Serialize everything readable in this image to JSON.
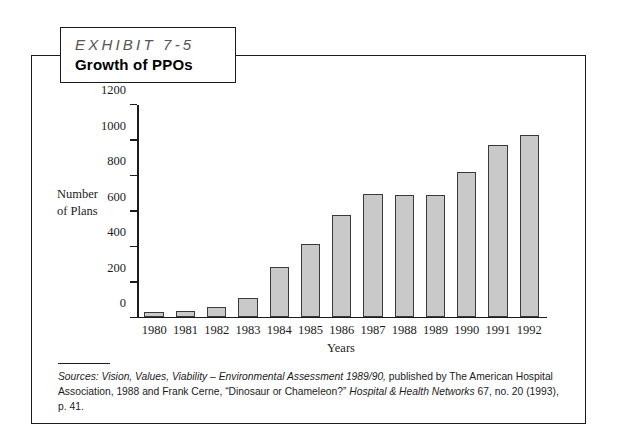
{
  "exhibit": {
    "kicker": "EXHIBIT 7-5",
    "title": "Growth of PPOs"
  },
  "source": {
    "label": "Sources:",
    "italic_1": "Vision, Values, Viability – Environmental Assessment 1989/90,",
    "plain_1": " published by The American Hospital Association, 1988 and Frank Cerne, “Dinosaur or Chameleon?” ",
    "italic_2": "Hospital & Health Networks",
    "plain_2": " 67, no. 20 (1993), p. 41."
  },
  "chart_data": {
    "type": "bar",
    "title": "Growth of PPOs",
    "xlabel": "Years",
    "ylabel": "Number of Plans",
    "ylim": [
      0,
      1200
    ],
    "yticks": [
      0,
      200,
      400,
      600,
      800,
      1000,
      1200
    ],
    "ytick_labels": [
      "0",
      "200",
      "400",
      "600",
      "800",
      "1000",
      "1200"
    ],
    "grid": false,
    "legend": null,
    "bar_color": "#c9c9c9",
    "bar_border_color": "#3a3a3a",
    "categories": [
      "1980",
      "1981",
      "1982",
      "1983",
      "1984",
      "1985",
      "1986",
      "1987",
      "1988",
      "1989",
      "1990",
      "1991",
      "1992"
    ],
    "values": [
      25,
      30,
      55,
      105,
      280,
      410,
      575,
      695,
      690,
      688,
      820,
      975,
      1030
    ]
  }
}
